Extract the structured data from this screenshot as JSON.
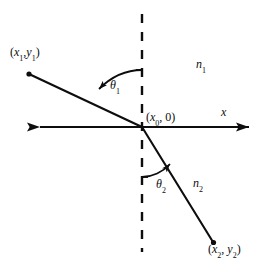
{
  "figure": {
    "background": "#ffffff",
    "stroke_color": "#0d0d0d",
    "width": 271,
    "height": 266
  },
  "labels": {
    "point1": {
      "open": "(",
      "x": "x",
      "xsub": "1",
      "comma": ",",
      "y": "y",
      "ysub": "1",
      "close": ")"
    },
    "point0": {
      "open": "(",
      "x": "x",
      "xsub": "0",
      "comma": ",",
      "zero": "0",
      "close": ")"
    },
    "point2": {
      "open": "(",
      "x": "x",
      "xsub": "2",
      "comma": ",",
      "y": "y",
      "ysub": "2",
      "close": ")"
    },
    "index1": {
      "sym": "n",
      "sub": "1"
    },
    "index2": {
      "sym": "n",
      "sub": "2"
    },
    "axis_x": "x",
    "theta1": {
      "sym": "θ",
      "sub": "1"
    },
    "theta2": {
      "sym": "θ",
      "sub": "2"
    }
  },
  "geometry": {
    "axis_y": 127,
    "axis_x_start": 27,
    "axis_x_end": 262,
    "normal_x": 142,
    "normal_top": 14,
    "normal_bottom": 252,
    "origin": {
      "x": 142,
      "y": 127
    },
    "point1": {
      "x": 28,
      "y": 73
    },
    "point2": {
      "x": 214,
      "y": 243
    },
    "theta1_arc_tick_y": 70,
    "theta2_arc_tick_y": 177
  },
  "colors": {
    "ink": "#0d0d0d",
    "paper": "#ffffff"
  }
}
